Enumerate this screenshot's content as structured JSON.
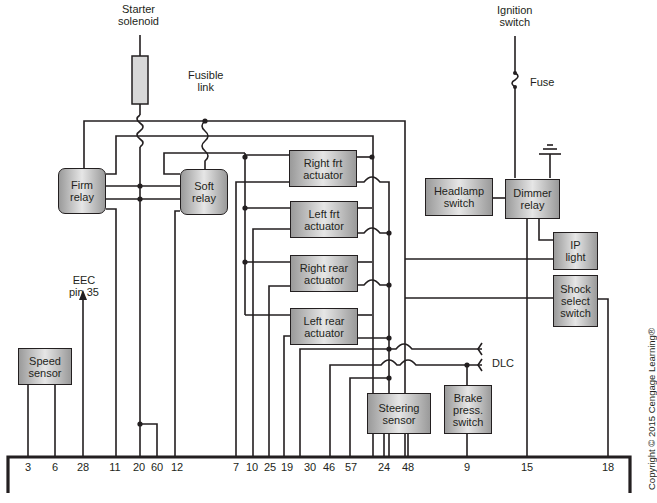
{
  "diagram": {
    "sources": {
      "starter_solenoid": "Starter\nsolenoid",
      "fusible_link": "Fusible\nlink",
      "ignition_switch": "Ignition\nswitch",
      "fuse": "Fuse",
      "eec": "EEC\npin 35",
      "dlc": "DLC"
    },
    "components": {
      "firm_relay": "Firm\nrelay",
      "soft_relay": "Soft\nrelay",
      "right_frt_actuator": "Right frt\nactuator",
      "left_frt_actuator": "Left frt\nactuator",
      "right_rear_actuator": "Right rear\nactuator",
      "left_rear_actuator": "Left rear\nactuator",
      "headlamp_switch": "Headlamp\nswitch",
      "dimmer_relay": "Dimmer\nrelay",
      "ip_light": "IP\nlight",
      "shock_select_switch": "Shock\nselect\nswitch",
      "speed_sensor": "Speed\nsensor",
      "steering_sensor": "Steering\nsensor",
      "brake_press_switch": "Brake\npress.\nswitch"
    },
    "module_pins": [
      "3",
      "6",
      "28",
      "11",
      "20",
      "60",
      "12",
      "7",
      "10",
      "25",
      "19",
      "30",
      "46",
      "57",
      "24",
      "48",
      "9",
      "15",
      "18"
    ],
    "copyright": "Copyright © 2015 Cengage Learning®"
  }
}
